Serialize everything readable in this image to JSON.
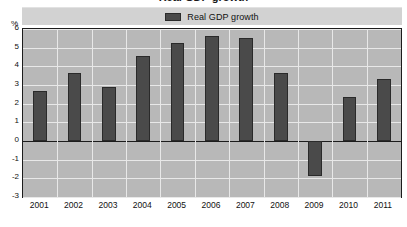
{
  "figure": {
    "title": "Real GDP growth"
  },
  "legend": {
    "label": "Real GDP growth",
    "swatch_color": "#4a4a4a",
    "position": "top-center"
  },
  "axes": {
    "unit_label": "%",
    "y_ticks": [
      "6",
      "5",
      "4",
      "3",
      "2",
      "1",
      "0",
      "-1",
      "-2",
      "-3"
    ],
    "x_ticks": [
      "2001",
      "2002",
      "2003",
      "2004",
      "2005",
      "2006",
      "2007",
      "2008",
      "2009",
      "2010",
      "2011"
    ]
  },
  "colors": {
    "bar": "#4a4a4a",
    "bar_edge": "#2a2a2a",
    "plot_background": "#b8b8b8",
    "legend_background": "#d2d2d2",
    "gridline": "#e8e8e8",
    "axis_line": "#1c1c1c",
    "page_background": "#ffffff"
  },
  "chart_data": {
    "type": "bar",
    "title": "Real GDP growth",
    "xlabel": "",
    "ylabel": "%",
    "ylim": [
      -3,
      6
    ],
    "ytick_values": [
      6,
      5,
      4,
      3,
      2,
      1,
      0,
      -1,
      -2,
      -3
    ],
    "grid": true,
    "legend_position": "top-center",
    "categories": [
      "2001",
      "2002",
      "2003",
      "2004",
      "2005",
      "2006",
      "2007",
      "2008",
      "2009",
      "2010",
      "2011"
    ],
    "series": [
      {
        "name": "Real GDP growth",
        "values": [
          2.7,
          3.65,
          2.9,
          4.55,
          5.25,
          5.6,
          5.5,
          3.65,
          -1.85,
          2.35,
          3.3
        ]
      }
    ]
  }
}
